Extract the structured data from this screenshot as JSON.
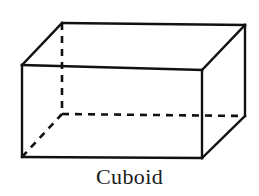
{
  "figure": {
    "name": "cuboid-diagram",
    "caption": "Cuboid",
    "background_color": "#ffffff",
    "line_color": "#111111",
    "visible_edge_width": 2.4,
    "hidden_edge_width": 2.6,
    "hidden_edge_dash": "7,6",
    "vertices": {
      "front_top_left": [
        22,
        65
      ],
      "front_top_right": [
        202,
        70
      ],
      "front_bottom_right": [
        202,
        158
      ],
      "front_bottom_left": [
        22,
        157
      ],
      "back_top_left": [
        62,
        23
      ],
      "back_top_right": [
        245,
        25
      ],
      "back_bottom_right": [
        245,
        116
      ],
      "back_bottom_left": [
        62,
        114
      ]
    },
    "visible_edges": [
      {
        "name": "front-face-top-edge",
        "from": "front_top_left",
        "to": "front_top_right"
      },
      {
        "name": "front-face-right-edge",
        "from": "front_top_right",
        "to": "front_bottom_right"
      },
      {
        "name": "front-face-bottom-edge",
        "from": "front_bottom_right",
        "to": "front_bottom_left"
      },
      {
        "name": "front-face-left-edge",
        "from": "front_bottom_left",
        "to": "front_top_left"
      },
      {
        "name": "top-face-back-edge",
        "from": "back_top_left",
        "to": "back_top_right"
      },
      {
        "name": "top-face-left-diagonal-edge",
        "from": "front_top_left",
        "to": "back_top_left"
      },
      {
        "name": "top-face-right-diagonal-edge",
        "from": "front_top_right",
        "to": "back_top_right"
      },
      {
        "name": "right-face-back-vertical-edge",
        "from": "back_top_right",
        "to": "back_bottom_right"
      },
      {
        "name": "right-face-bottom-diagonal-edge",
        "from": "front_bottom_right",
        "to": "back_bottom_right"
      }
    ],
    "hidden_edges": [
      {
        "name": "hidden-back-left-vertical-edge",
        "from": "back_top_left",
        "to": "back_bottom_left"
      },
      {
        "name": "hidden-bottom-back-edge",
        "from": "back_bottom_left",
        "to": "back_bottom_right"
      },
      {
        "name": "hidden-bottom-left-diagonal-edge",
        "from": "front_bottom_left",
        "to": "back_bottom_left"
      }
    ]
  }
}
